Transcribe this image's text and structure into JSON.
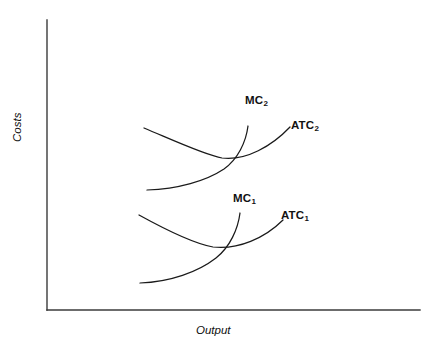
{
  "figure": {
    "background": "#ffffff",
    "line_color": "#1a1a1a",
    "axis_color": "#3b3b3b"
  },
  "axes": {
    "ylabel": "Costs",
    "xlabel": "Output",
    "x_range_px": [
      47,
      420
    ],
    "y_range_px": [
      20,
      310
    ],
    "ticks": [],
    "grid": false
  },
  "labels": {
    "mc2_base": "MC",
    "mc2_sub": "2",
    "atc2_base": "ATC",
    "atc2_sub": "2",
    "mc1_base": "MC",
    "mc1_sub": "1",
    "atc1_base": "ATC",
    "atc1_sub": "1"
  },
  "chart_data": {
    "type": "line",
    "title": "",
    "xlabel": "Output",
    "ylabel": "Costs",
    "grid": false,
    "legend": "inline curve labels",
    "axis_note": "Unlabeled qualitative axes; no numeric tick marks shown.",
    "series": [
      {
        "name": "ATC2",
        "label": "ATC₂",
        "shape": "u-shaped average total cost",
        "path": "M 144 128 C 175 141 205 155 222 158 C 246 161 272 146 290 127",
        "points_px": [
          [
            144,
            128
          ],
          [
            170,
            145
          ],
          [
            196,
            155
          ],
          [
            222,
            158
          ],
          [
            252,
            152
          ],
          [
            272,
            142
          ],
          [
            290,
            127
          ]
        ],
        "minimum_px": [
          222,
          158
        ]
      },
      {
        "name": "MC2",
        "label": "MC₂",
        "shape": "rising marginal cost",
        "path": "M 147 190 C 178 189 206 181 224 169 C 238 159 246 142 248 126",
        "points_px": [
          [
            147,
            190
          ],
          [
            172,
            189
          ],
          [
            196,
            183
          ],
          [
            216,
            174
          ],
          [
            233,
            157
          ],
          [
            243,
            141
          ],
          [
            248,
            126
          ]
        ],
        "intersects": "ATC2 at its minimum"
      },
      {
        "name": "ATC1",
        "label": "ATC₁",
        "shape": "u-shaped average total cost",
        "path": "M 139 215 C 168 231 196 244 213 247 C 238 250 265 238 283 220",
        "points_px": [
          [
            139,
            215
          ],
          [
            165,
            233
          ],
          [
            190,
            244
          ],
          [
            213,
            247
          ],
          [
            245,
            242
          ],
          [
            265,
            233
          ],
          [
            283,
            220
          ]
        ],
        "minimum_px": [
          213,
          247
        ]
      },
      {
        "name": "MC1",
        "label": "MC₁",
        "shape": "rising marginal cost",
        "path": "M 140 283 C 170 282 198 272 216 258 C 230 247 238 229 240 213",
        "points_px": [
          [
            140,
            283
          ],
          [
            166,
            282
          ],
          [
            190,
            275
          ],
          [
            208,
            266
          ],
          [
            223,
            247
          ],
          [
            235,
            230
          ],
          [
            240,
            213
          ]
        ],
        "intersects": "ATC1 at its minimum"
      }
    ]
  }
}
